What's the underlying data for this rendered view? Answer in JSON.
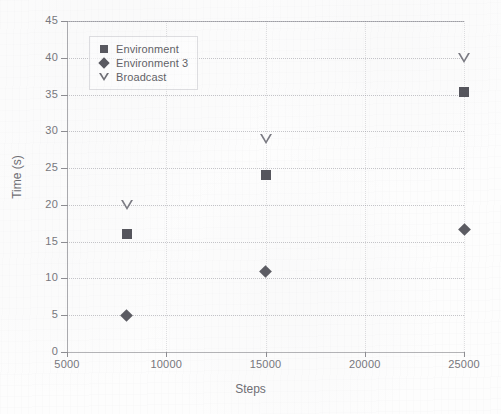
{
  "chart_data": {
    "type": "scatter",
    "title": "",
    "xlabel": "Steps",
    "ylabel": "Time (s)",
    "xlim": [
      5000,
      25000
    ],
    "ylim": [
      0,
      45
    ],
    "xticks": [
      "5000",
      "10000",
      "15000",
      "20000",
      "25000"
    ],
    "yticks": [
      "0",
      "5",
      "10",
      "15",
      "20",
      "25",
      "30",
      "35",
      "40",
      "45"
    ],
    "grid": true,
    "legend_position": "upper left",
    "x": [
      8000,
      15000,
      25000
    ],
    "series": [
      {
        "name": "Environment",
        "marker": "square-filled",
        "color": "#55555c",
        "values": [
          16.0,
          24.1,
          35.3
        ]
      },
      {
        "name": "Environment 3",
        "marker": "diamond-filled",
        "color": "#5b5b62",
        "values": [
          4.9,
          11.0,
          16.6
        ]
      },
      {
        "name": "Broadcast",
        "marker": "triangle-down-open",
        "color": "#7a7a82",
        "values": [
          20.0,
          29.0,
          40.0
        ]
      }
    ]
  },
  "legend": {
    "items": [
      {
        "label": "Environment"
      },
      {
        "label": "Environment 3"
      },
      {
        "label": "Broadcast"
      }
    ]
  },
  "axes": {
    "x_title": "Steps",
    "y_title": "Time (s)"
  }
}
